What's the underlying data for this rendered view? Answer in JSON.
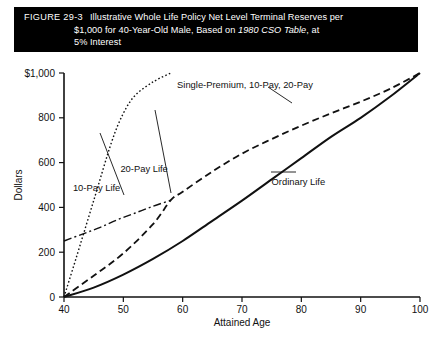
{
  "figure": {
    "number": "FIGURE 29-3",
    "caption_line1": "Illustrative Whole Life Policy Net Level Terminal Reserves per",
    "caption_line2_a": "$1,000 for 40-Year-Old Male, Based on ",
    "caption_line2_italic": "1980 CSO Table",
    "caption_line2_b": ", at",
    "caption_line3": "5% Interest",
    "caption_bg": "#000000",
    "caption_fg": "#ffffff"
  },
  "chart_data": {
    "type": "line",
    "title": "Illustrative Whole Life Policy Net Level Terminal Reserves per $1,000 for 40-Year-Old Male, Based on 1980 CSO Table, at 5% Interest",
    "xlabel": "Attained Age",
    "ylabel": "Dollars",
    "xlim": [
      40,
      100
    ],
    "ylim": [
      0,
      1000
    ],
    "xticks": [
      40,
      50,
      60,
      70,
      80,
      90,
      100
    ],
    "xticklabels": [
      "40",
      "50",
      "60",
      "70",
      "80",
      "90",
      "100"
    ],
    "yticks": [
      0,
      200,
      400,
      600,
      800,
      1000
    ],
    "yticklabels": [
      "0",
      "200",
      "400",
      "600",
      "800",
      "$1,000"
    ],
    "grid": false,
    "legend_position": "inline-annotations",
    "series": [
      {
        "name": "Single-Premium Life",
        "style": "dotted-steep",
        "annotation": "Single-Premium, 10-Pay, 20-Pay",
        "x": [
          40,
          42,
          45,
          48,
          50,
          52,
          55,
          58
        ],
        "y": [
          0,
          170,
          430,
          690,
          820,
          900,
          960,
          1000
        ]
      },
      {
        "name": "10-Pay Life",
        "style": "dash-dot",
        "annotation": "10-Pay Life",
        "x": [
          40,
          43,
          46,
          49,
          52,
          55,
          58
        ],
        "y": [
          250,
          280,
          310,
          345,
          375,
          405,
          432
        ]
      },
      {
        "name": "20-Pay Life",
        "style": "dashed",
        "annotation": "20-Pay Life",
        "x": [
          40,
          45,
          50,
          55,
          58,
          60,
          65,
          70,
          75,
          80,
          85,
          90,
          95,
          100
        ],
        "y": [
          0,
          95,
          195,
          325,
          432,
          470,
          560,
          640,
          705,
          765,
          820,
          872,
          930,
          1000
        ]
      },
      {
        "name": "Ordinary Life",
        "style": "solid",
        "annotation": "Ordinary Life",
        "x": [
          40,
          45,
          50,
          55,
          60,
          65,
          70,
          75,
          80,
          85,
          90,
          95,
          100
        ],
        "y": [
          0,
          42,
          100,
          170,
          250,
          340,
          430,
          525,
          620,
          715,
          800,
          895,
          1000
        ]
      }
    ],
    "annotations": [
      {
        "text": "Single-Premium, 10-Pay, 20-Pay",
        "x": 70.5,
        "y": 935
      },
      {
        "text": "20-Pay Life",
        "x": 53.5,
        "y": 560
      },
      {
        "text": "10-Pay Life",
        "x": 45.5,
        "y": 475
      },
      {
        "text": "Ordinary Life",
        "x": 79.5,
        "y": 500
      }
    ]
  }
}
